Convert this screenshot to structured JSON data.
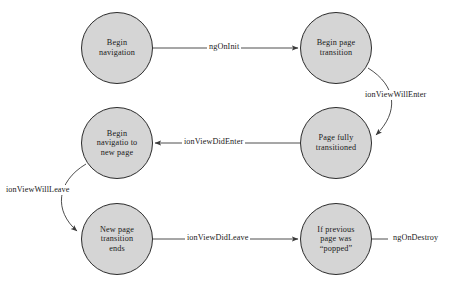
{
  "diagram": {
    "type": "state-transition-diagram",
    "canvas": {
      "width": 452,
      "height": 289,
      "background": "#ffffff"
    },
    "style": {
      "node_fill": "#d5d5d5",
      "node_stroke": "#2b2b2b",
      "edge_stroke": "#3a3a3a",
      "text_color": "#1a1a1a",
      "node_diameter": 71
    },
    "nodes": [
      {
        "id": "begin-navigation",
        "label": "Begin\nnavigation",
        "cx": 117,
        "cy": 48
      },
      {
        "id": "begin-page-transition",
        "label": "Begin page\ntransition",
        "cx": 336,
        "cy": 48
      },
      {
        "id": "begin-navigation-new-page",
        "label": "Begin\nnavigatio to\nnew page",
        "cx": 117,
        "cy": 143
      },
      {
        "id": "page-fully-transitioned",
        "label": "Page fully\ntransitioned",
        "cx": 336,
        "cy": 143
      },
      {
        "id": "new-page-transition-ends",
        "label": "New page\ntransition\nends",
        "cx": 117,
        "cy": 239
      },
      {
        "id": "previous-page-popped",
        "label": "If previous\npage was\n“popped”",
        "cx": 336,
        "cy": 239
      }
    ],
    "edges": [
      {
        "id": "ng-on-init",
        "label": "ngOnInit",
        "from": "begin-navigation",
        "to": "begin-page-transition",
        "shape": "straight",
        "label_x": 224,
        "label_y": 43
      },
      {
        "id": "ion-view-will-enter",
        "label": "ionViewWillEnter",
        "from": "begin-page-transition",
        "to": "page-fully-transitioned",
        "shape": "curve-right",
        "label_x": 366,
        "label_y": 91
      },
      {
        "id": "ion-view-did-enter",
        "label": "ionViewDidEnter",
        "from": "page-fully-transitioned",
        "to": "begin-navigation-new-page",
        "shape": "straight",
        "label_x": 188,
        "label_y": 138
      },
      {
        "id": "ion-view-will-leave",
        "label": "ionViewWillLeave",
        "from": "begin-navigation-new-page",
        "to": "new-page-transition-ends",
        "shape": "curve-left",
        "label_x": 5,
        "label_y": 186
      },
      {
        "id": "ion-view-did-leave",
        "label": "ionViewDidLeave",
        "from": "new-page-transition-ends",
        "to": "previous-page-popped",
        "shape": "straight",
        "label_x": 190,
        "label_y": 234
      },
      {
        "id": "ng-on-destroy",
        "label": "ngOnDestroy",
        "from": "previous-page-popped",
        "to": null,
        "shape": "stub-right",
        "label_x": 389,
        "label_y": 234
      }
    ]
  }
}
